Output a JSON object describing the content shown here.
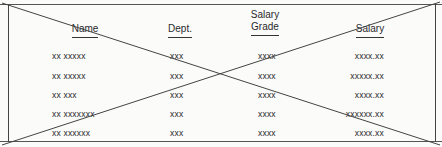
{
  "table": {
    "columns": [
      {
        "key": "name",
        "label": "Name"
      },
      {
        "key": "dept",
        "label": "Dept."
      },
      {
        "key": "grade",
        "label_line1": "Salary",
        "label_line2": "Grade"
      },
      {
        "key": "salary",
        "label": "Salary"
      }
    ],
    "rows": [
      {
        "name": "xx xxxxx",
        "dept": "xxx",
        "grade": "xxxx",
        "salary": "xxxx.xx"
      },
      {
        "name": "xx xxxxx",
        "dept": "xxx",
        "grade": "xxxx",
        "salary": "xxxxx.xx"
      },
      {
        "name": "xx xxx",
        "dept": "xxx",
        "grade": "xxxx",
        "salary": "xxxx.xx"
      },
      {
        "name": "xx xxxxxxx",
        "dept": "xxx",
        "grade": "xxxx",
        "salary": "xxxxxx.xx"
      },
      {
        "name": "xx xxxxxx",
        "dept": "xxx",
        "grade": "xxxx",
        "salary": "xxxx.xx"
      }
    ]
  },
  "annotation": {
    "type": "crossed-out",
    "color": "#444444"
  }
}
